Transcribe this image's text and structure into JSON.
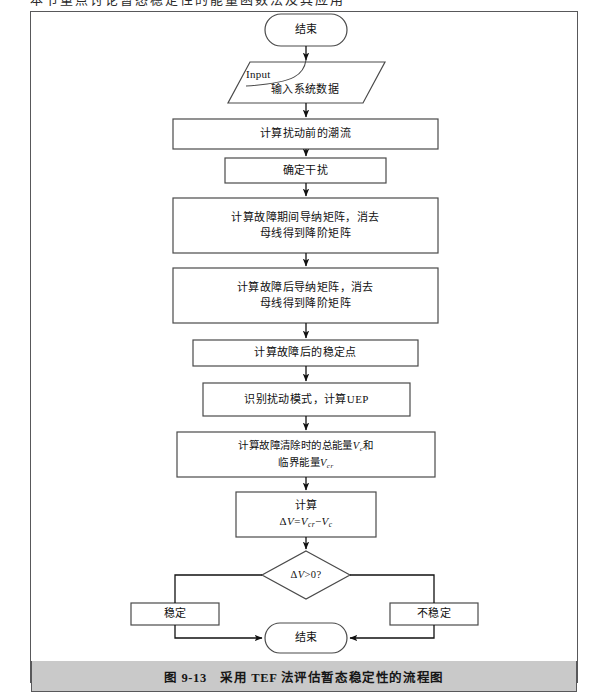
{
  "page": {
    "header_cutoff_text": "本节重点讨论暂态稳定性的能量函数法及其应用",
    "caption": "图 9-13　采用 TEF 法评估暂态稳定性的流程图"
  },
  "colors": {
    "frame_border": "#58585a",
    "caption_bar": "#c9c9c9",
    "shape_stroke": "#4a4a4a",
    "connector": "#1a1a1a",
    "text": "#111111",
    "page_background": "#ffffff"
  },
  "flowchart": {
    "type": "flowchart",
    "title": "采用 TEF 法评估暂态稳定性的流程图",
    "nodes": [
      {
        "id": "start",
        "shape": "terminator",
        "label": "结束",
        "x": 265,
        "y": 14,
        "w": 82,
        "h": 32
      },
      {
        "id": "input_data",
        "shape": "parallelogram",
        "label": "输入系统数据",
        "annotation": "Input",
        "x": 228,
        "y": 62,
        "w": 157,
        "h": 41
      },
      {
        "id": "prefault_powerflow",
        "shape": "process",
        "label": "计算扰动前的潮流",
        "x": 173,
        "y": 119,
        "w": 265,
        "h": 30
      },
      {
        "id": "determine_disturbance",
        "shape": "process",
        "label": "确定干扰",
        "x": 225,
        "y": 158,
        "w": 161,
        "h": 25
      },
      {
        "id": "fault_admittance",
        "shape": "process",
        "line1": "计算故障期间导纳矩阵，消去",
        "line2": "母线得到降阶矩阵",
        "x": 173,
        "y": 198,
        "w": 265,
        "h": 55
      },
      {
        "id": "postfault_admittance",
        "shape": "process",
        "line1": "计算故障后导纳矩阵，消去",
        "line2": "母线得到降阶矩阵",
        "x": 173,
        "y": 268,
        "w": 265,
        "h": 55
      },
      {
        "id": "postfault_sep",
        "shape": "process",
        "label": "计算故障后的稳定点",
        "x": 193,
        "y": 340,
        "w": 225,
        "h": 26
      },
      {
        "id": "identify_mode_uep",
        "shape": "process",
        "label": "识别扰动模式，计算UEP",
        "x": 203,
        "y": 383,
        "w": 207,
        "h": 33
      },
      {
        "id": "compute_energies",
        "shape": "process",
        "line1_pre": "计算故障清除时的总能量",
        "line1_var": "V",
        "line1_sub": "c",
        "line1_post": "和",
        "line2_pre": "临界能量",
        "line2_var": "V",
        "line2_sub": "cr",
        "x": 177,
        "y": 432,
        "w": 258,
        "h": 45
      },
      {
        "id": "compute_delta_v",
        "shape": "process",
        "label": "计算",
        "formula_parts": {
          "delta": "Δ",
          "v": "V",
          "eq": "=",
          "vcr_var": "V",
          "vcr_sub": "cr",
          "minus": "−",
          "vc_var": "V",
          "vc_sub": "c"
        },
        "x": 236,
        "y": 492,
        "w": 140,
        "h": 45
      },
      {
        "id": "decision",
        "shape": "decision",
        "label_delta": "Δ",
        "label_v": "V",
        "label_rest": ">0?",
        "cx": 306,
        "cy": 575,
        "w": 88,
        "h": 48
      },
      {
        "id": "stable",
        "shape": "process",
        "label": "稳定",
        "x": 131,
        "y": 603,
        "w": 88,
        "h": 22
      },
      {
        "id": "unstable",
        "shape": "process",
        "label": "不稳定",
        "x": 390,
        "y": 603,
        "w": 88,
        "h": 22
      },
      {
        "id": "end",
        "shape": "terminator",
        "label": "结束",
        "x": 265,
        "y": 623,
        "w": 82,
        "h": 30
      }
    ],
    "edges": [
      {
        "from": "start",
        "to": "input_data",
        "arrow": true
      },
      {
        "from": "input_data",
        "to": "prefault_powerflow",
        "arrow": true
      },
      {
        "from": "prefault_powerflow",
        "to": "determine_disturbance",
        "arrow": true
      },
      {
        "from": "determine_disturbance",
        "to": "fault_admittance",
        "arrow": true
      },
      {
        "from": "fault_admittance",
        "to": "postfault_admittance",
        "arrow": true
      },
      {
        "from": "postfault_admittance",
        "to": "postfault_sep",
        "arrow": true
      },
      {
        "from": "postfault_sep",
        "to": "identify_mode_uep",
        "arrow": true
      },
      {
        "from": "identify_mode_uep",
        "to": "compute_energies",
        "arrow": true
      },
      {
        "from": "compute_energies",
        "to": "compute_delta_v",
        "arrow": true
      },
      {
        "from": "compute_delta_v",
        "to": "decision",
        "arrow": true
      },
      {
        "from": "decision",
        "to": "stable",
        "arrow": false,
        "side": "left"
      },
      {
        "from": "decision",
        "to": "unstable",
        "arrow": false,
        "side": "right"
      },
      {
        "from": "stable",
        "to": "end",
        "arrow": true
      },
      {
        "from": "unstable",
        "to": "end",
        "arrow": true
      }
    ]
  }
}
